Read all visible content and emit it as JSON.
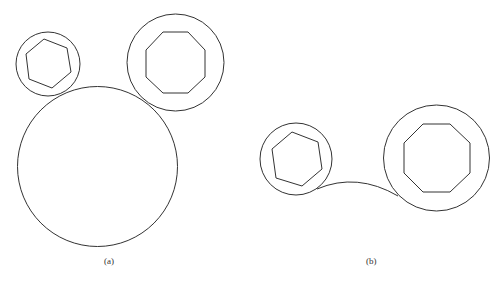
{
  "figure": {
    "stroke": "#333333",
    "panels": [
      {
        "id": "a",
        "label": "(a)",
        "label_pos": [
          104,
          256
        ],
        "circles": [
          {
            "name": "small-circle",
            "cx": 48,
            "cy": 64,
            "r": 32
          },
          {
            "name": "top-right-circle",
            "cx": 175.5,
            "cy": 62.5,
            "r": 48.5
          },
          {
            "name": "large-circle",
            "cx": 97.5,
            "cy": 166.5,
            "r": 80
          }
        ],
        "polygons": [
          {
            "name": "hexagon",
            "points": "44,39 67,48 71,72 52,88 29,79 26,54"
          },
          {
            "name": "octagon",
            "points": "163,32 188,32 205,50 205,77 188,93 163,93 146,77 146,50"
          }
        ],
        "arcs": []
      },
      {
        "id": "b",
        "label": "(b)",
        "label_pos": [
          366,
          256
        ],
        "circles": [
          {
            "name": "small-circle",
            "cx": 296,
            "cy": 159,
            "r": 36
          },
          {
            "name": "large-circle",
            "cx": 436.5,
            "cy": 158,
            "r": 53
          }
        ],
        "polygons": [
          {
            "name": "hexagon",
            "points": "292,132 318,142 322,169 302,186 276,178 272,149"
          },
          {
            "name": "octagon",
            "points": "423,124 450,124 470,143 470,173 450,192 423,192 404,173 404,143"
          }
        ],
        "arcs": [
          {
            "name": "connecting-arc",
            "d": "M317,189 Q357,172 398,196"
          }
        ]
      }
    ]
  },
  "caption": {
    "visible": "partial",
    "segments": [
      8,
      10,
      10,
      12,
      10,
      10,
      10
    ]
  }
}
